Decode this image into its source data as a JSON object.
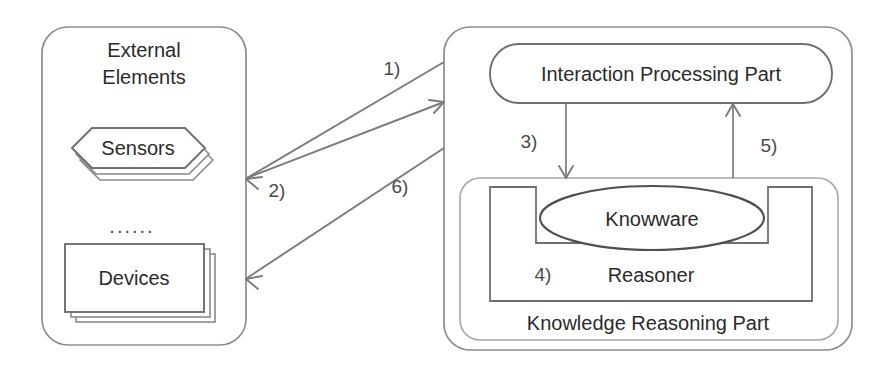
{
  "diagram": {
    "left_panel": {
      "name": "external-elements",
      "label_line1": "External",
      "label_line2": "Elements",
      "sensors_label": "Sensors",
      "ellipsis_label": "......",
      "devices_label": "Devices"
    },
    "right_panel": {
      "name": "system-panel",
      "interaction_label": "Interaction Processing Part",
      "knowledge_label": "Knowledge Reasoning Part",
      "knowware_label": "Knowware",
      "reasoner_label": "Reasoner"
    },
    "steps": {
      "s1": "1)",
      "s2": "2)",
      "s3": "3)",
      "s4": "4)",
      "s5": "5)",
      "s6": "6)"
    },
    "colors": {
      "background": "#ffffff",
      "outline_strong": "#6f6f6f",
      "outline_soft": "#a6a6a6",
      "arrow": "#7b7b7b",
      "text": "#2b2b2b"
    }
  }
}
